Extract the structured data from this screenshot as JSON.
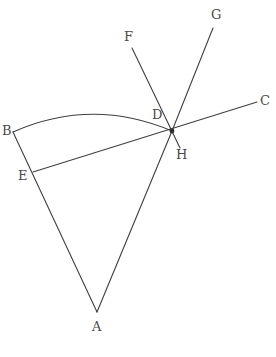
{
  "figure": {
    "type": "geometry-diagram",
    "background_color": "#ffffff",
    "stroke_color": "#3f3f3f",
    "label_color": "#4a4a4a",
    "stroke_width": 1.1,
    "width": 276,
    "height": 357
  },
  "labels": {
    "A": "A",
    "B": "B",
    "C": "C",
    "D": "D",
    "E": "E",
    "F": "F",
    "G": "G",
    "H": "H"
  },
  "points": [
    {
      "id": "A",
      "label": "A",
      "x": 97,
      "y": 312,
      "label_x": 92,
      "label_y": 320
    },
    {
      "id": "B",
      "label": "B",
      "x": 13,
      "y": 132,
      "label_x": 2,
      "label_y": 124
    },
    {
      "id": "C",
      "label": "C",
      "x": 257,
      "y": 102,
      "label_x": 260,
      "label_y": 94
    },
    {
      "id": "D",
      "label": "D",
      "x": 166,
      "y": 124,
      "label_x": 152,
      "label_y": 108
    },
    {
      "id": "E",
      "label": "E",
      "x": 33,
      "y": 172,
      "label_x": 18,
      "label_y": 169
    },
    {
      "id": "F",
      "label": "F",
      "x": 132,
      "y": 48,
      "label_x": 124,
      "label_y": 30
    },
    {
      "id": "G",
      "label": "G",
      "x": 213,
      "y": 28,
      "label_x": 211,
      "label_y": 8
    },
    {
      "id": "H",
      "label": "H",
      "x": 180,
      "y": 148,
      "label_x": 176,
      "label_y": 148
    }
  ],
  "node": {
    "id": "intersection",
    "x": 172,
    "y": 131,
    "radius": 2.4
  },
  "segments": [
    {
      "id": "seg-A-B",
      "from": "A",
      "to": "B",
      "x1": 97,
      "y1": 312,
      "x2": 13,
      "y2": 132
    },
    {
      "id": "seg-A-node",
      "from": "A",
      "to": "intersection",
      "x1": 97,
      "y1": 312,
      "x2": 172,
      "y2": 131
    },
    {
      "id": "seg-E-C",
      "from": "E",
      "to": "C",
      "x1": 33,
      "y1": 172,
      "x2": 257,
      "y2": 102
    },
    {
      "id": "seg-F-H",
      "from": "F",
      "to": "H",
      "x1": 132,
      "y1": 48,
      "x2": 180,
      "y2": 148
    },
    {
      "id": "seg-G-node",
      "from": "G",
      "to": "intersection",
      "x1": 213,
      "y1": 28,
      "x2": 172,
      "y2": 131
    }
  ],
  "arcs": [
    {
      "id": "arc-B-node",
      "from": "B",
      "to": "intersection",
      "start_x": 13,
      "start_y": 132,
      "control_x": 92,
      "control_y": 97,
      "end_x": 172,
      "end_y": 131
    }
  ]
}
